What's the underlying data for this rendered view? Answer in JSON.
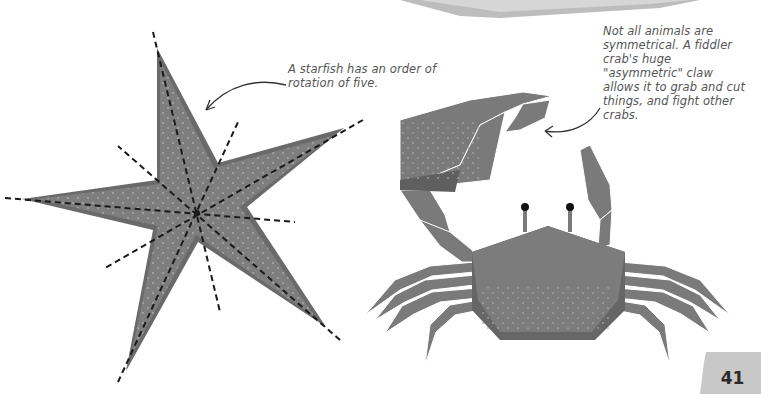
{
  "page": {
    "number": "41",
    "colors": {
      "background": "#ffffff",
      "body_fill": "#7a7a7a",
      "body_shadow": "#606060",
      "dots": "#a8a8a8",
      "dashes": "#1a1a1a",
      "caption_text": "#555555",
      "tab": "#c8c8c8"
    }
  },
  "illustrations": {
    "starfish": {
      "label": "starfish",
      "arms": 5,
      "symmetry_lines": 5
    },
    "crab": {
      "label": "fiddler crab",
      "legs_per_side": 4
    }
  },
  "captions": {
    "starfish": "A starfish has an order of rotation of five.",
    "crab": "Not all animals are symmetrical. A fiddler crab's huge \"asymmetric\" claw allows it to grab and cut things, and fight other crabs."
  }
}
